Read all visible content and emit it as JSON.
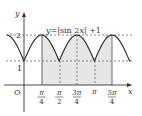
{
  "chart_data": {
    "type": "line",
    "equation": "y=|sin2x|+1",
    "xlabel": "x",
    "ylabel": "y",
    "origin_label": "O",
    "x_ticks": [
      {
        "num": "π",
        "den": "4",
        "value": 0.7854
      },
      {
        "num": "π",
        "den": "2",
        "value": 1.5708
      },
      {
        "num": "3π",
        "den": "4",
        "value": 2.3562
      },
      {
        "num": "π",
        "den": "",
        "value": 3.1416
      },
      {
        "num": "5π",
        "den": "4",
        "value": 3.927
      }
    ],
    "y_ticks": [
      {
        "label": "1",
        "value": 1
      },
      {
        "label": "2",
        "value": 2
      }
    ],
    "shaded_region": {
      "x_from": "π/4",
      "x_to": "5π/4",
      "color": "#e6e6e6"
    },
    "dashed_lines": [
      "y=1",
      "y=2",
      "x=π/2",
      "x=3π/4",
      "x=π"
    ],
    "solid_verticals": [
      "x=π/4",
      "x=5π/4"
    ],
    "x_range": [
      -0.85,
      4.45
    ],
    "y_range": [
      -0.7,
      2.6
    ],
    "grid": false
  }
}
